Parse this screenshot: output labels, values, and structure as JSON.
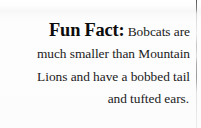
{
  "callout": {
    "label": "Fun Fact:",
    "lines": [
      "Bobcats are",
      "much smaller than Mountain",
      "Lions and have a bobbed tail",
      "and tufted ears."
    ],
    "full_text": "Fun Fact: Bobcats are much smaller than Mountain Lions and have a bobbed tail and tufted ears.",
    "alignment": "right",
    "text_color": "#1a1a1a",
    "label_color": "#0c0c0c",
    "background_color": "#fcfcfc"
  }
}
